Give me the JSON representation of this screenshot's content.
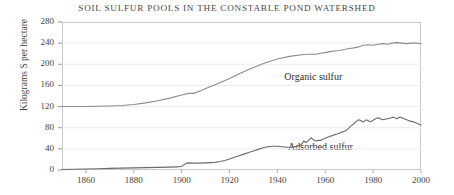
{
  "chart_data": {
    "type": "line",
    "title": "SOIL SULFUR POOLS IN THE CONSTABLE POND WATERSHED",
    "xlabel": "",
    "ylabel": "Kilograms S per hectare",
    "xlim": [
      1850,
      2000
    ],
    "ylim": [
      0,
      280
    ],
    "grid": true,
    "legend_position": "inline-annotation",
    "x_ticks": [
      1860,
      1880,
      1900,
      1920,
      1940,
      1960,
      1980,
      2000
    ],
    "y_ticks": [
      0,
      40,
      80,
      120,
      160,
      200,
      240,
      280
    ],
    "annotations": [
      {
        "text": "Organic sulfur",
        "x": 1955,
        "y": 175
      },
      {
        "text": "Adsorbed sulfur",
        "x": 1958,
        "y": 42
      }
    ],
    "series": [
      {
        "name": "Organic sulfur",
        "color": "#8c8c8c",
        "x": [
          1850,
          1855,
          1860,
          1865,
          1870,
          1875,
          1880,
          1885,
          1890,
          1895,
          1900,
          1903,
          1905,
          1908,
          1910,
          1915,
          1920,
          1925,
          1930,
          1935,
          1940,
          1945,
          1950,
          1953,
          1956,
          1958,
          1960,
          1962,
          1964,
          1966,
          1968,
          1970,
          1972,
          1974,
          1976,
          1978,
          1980,
          1982,
          1984,
          1986,
          1988,
          1990,
          1992,
          1994,
          1996,
          1998,
          2000
        ],
        "y": [
          120,
          120,
          120,
          120.5,
          121,
          122,
          124,
          127,
          131,
          136,
          142,
          145,
          145,
          150,
          154,
          163,
          173,
          184,
          194,
          203,
          210,
          215,
          218,
          219,
          219,
          221,
          222,
          224,
          225,
          226,
          228,
          230,
          231,
          233,
          236,
          237,
          236,
          238,
          239,
          238,
          240,
          241,
          240,
          239,
          240,
          240,
          239
        ]
      },
      {
        "name": "Adsorbed sulfur",
        "color": "#6b6b6b",
        "x": [
          1850,
          1855,
          1860,
          1865,
          1870,
          1875,
          1880,
          1885,
          1890,
          1895,
          1898,
          1900,
          1901,
          1902,
          1903,
          1904,
          1906,
          1908,
          1910,
          1912,
          1914,
          1916,
          1918,
          1920,
          1922,
          1924,
          1926,
          1928,
          1930,
          1932,
          1934,
          1936,
          1938,
          1940,
          1942,
          1944,
          1946,
          1948,
          1950,
          1951,
          1952,
          1953,
          1954,
          1955,
          1956,
          1957,
          1958,
          1959,
          1960,
          1961,
          1962,
          1963,
          1964,
          1965,
          1966,
          1967,
          1968,
          1969,
          1970,
          1971,
          1972,
          1973,
          1974,
          1975,
          1976,
          1977,
          1978,
          1979,
          1980,
          1981,
          1982,
          1983,
          1984,
          1985,
          1986,
          1987,
          1988,
          1989,
          1990,
          1991,
          1992,
          1993,
          1994,
          1995,
          1996,
          1997,
          1998,
          1999,
          2000
        ],
        "y": [
          1,
          1.5,
          2,
          2.5,
          3,
          3.5,
          4,
          4.5,
          5,
          5.5,
          6,
          6.5,
          10,
          13,
          13.5,
          13,
          13,
          13,
          13.5,
          14,
          14.5,
          16,
          18,
          21,
          24,
          27,
          30,
          33,
          36,
          39,
          42,
          44,
          45,
          45,
          44,
          43,
          43,
          45,
          48,
          55,
          52,
          56,
          61,
          57,
          55,
          56,
          56,
          58,
          60,
          62,
          64,
          65,
          67,
          68,
          70,
          72,
          73,
          76,
          80,
          84,
          88,
          92,
          95,
          93,
          91,
          95,
          93,
          91,
          94,
          97,
          99,
          97,
          95,
          96,
          97,
          98,
          100,
          99,
          97,
          100,
          99,
          97,
          95,
          93,
          92,
          91,
          89,
          87,
          85
        ]
      }
    ]
  },
  "axis": {
    "y_title": "Kilograms S per hectare"
  }
}
